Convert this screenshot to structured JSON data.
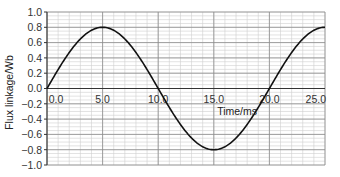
{
  "chart_data": {
    "type": "line",
    "title": "",
    "xlabel": "Time/ms",
    "ylabel": "Flux linkage/Wb",
    "xlim": [
      0,
      25
    ],
    "ylim": [
      -1.0,
      1.0
    ],
    "x_ticks": [
      "0.0",
      "5.0",
      "10.0",
      "15.0",
      "20.0",
      "25.0"
    ],
    "y_ticks": [
      "1.0",
      "0.8",
      "0.6",
      "0.4",
      "0.2",
      "0.0",
      "-0.2",
      "-0.4",
      "-0.6",
      "-0.8",
      "-1.0"
    ],
    "grid": true,
    "legend": null,
    "series": [
      {
        "name": "flux linkage",
        "x": [
          0,
          1,
          2,
          2.5,
          3,
          4,
          5,
          6,
          7,
          7.5,
          8,
          9,
          10,
          11,
          12,
          12.5,
          13,
          14,
          15,
          16,
          17,
          17.5,
          18,
          19,
          20,
          21,
          22,
          22.5,
          23,
          24,
          25
        ],
        "values": [
          0,
          0.247,
          0.47,
          0.566,
          0.647,
          0.761,
          0.8,
          0.761,
          0.647,
          0.566,
          0.47,
          0.247,
          0,
          -0.247,
          -0.47,
          -0.566,
          -0.647,
          -0.761,
          -0.8,
          -0.761,
          -0.647,
          -0.566,
          -0.47,
          -0.247,
          0,
          0.247,
          0.47,
          0.566,
          0.647,
          0.761,
          0.8
        ]
      }
    ],
    "colors": {
      "curve": "#111111",
      "major_grid": "#8c8c8c",
      "minor_grid": "#cfcfcf",
      "axis": "#222222"
    }
  }
}
